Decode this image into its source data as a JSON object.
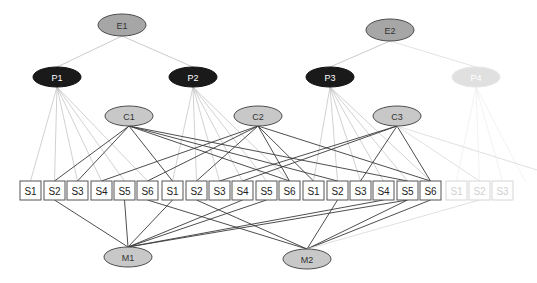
{
  "colors": {
    "e_fill": "#a6a6a6",
    "p_fill": "#1a1a1a",
    "p_faded_fill": "#e0e0e0",
    "c_fill": "#c8c8c8",
    "m_fill": "#c8c8c8",
    "stroke": "#4d4d4d",
    "light_line": "#bdbdbd",
    "dark_line": "#3a3a3a",
    "faded": "#dcdcdc",
    "box_stroke": "#555555"
  },
  "nodes": {
    "E1": {
      "label": "E1",
      "x": 122,
      "y": 25,
      "rx": 24,
      "ry": 11,
      "type": "e"
    },
    "E2": {
      "label": "E2",
      "x": 390,
      "y": 30,
      "rx": 24,
      "ry": 11,
      "type": "e"
    },
    "P1": {
      "label": "P1",
      "x": 57,
      "y": 77,
      "rx": 24,
      "ry": 10,
      "type": "p"
    },
    "P2": {
      "label": "P2",
      "x": 193,
      "y": 77,
      "rx": 24,
      "ry": 10,
      "type": "p"
    },
    "P3": {
      "label": "P3",
      "x": 330,
      "y": 77,
      "rx": 24,
      "ry": 10,
      "type": "p"
    },
    "P4": {
      "label": "P4",
      "x": 476,
      "y": 77,
      "rx": 24,
      "ry": 10,
      "type": "p_faded"
    },
    "C1": {
      "label": "C1",
      "x": 129,
      "y": 116,
      "rx": 24,
      "ry": 10,
      "type": "c"
    },
    "C2": {
      "label": "C2",
      "x": 258,
      "y": 116,
      "rx": 24,
      "ry": 10,
      "type": "c"
    },
    "C3": {
      "label": "C3",
      "x": 397,
      "y": 116,
      "rx": 24,
      "ry": 10,
      "type": "c"
    },
    "M1": {
      "label": "M1",
      "x": 128,
      "y": 257,
      "rx": 24,
      "ry": 10,
      "type": "m"
    },
    "M2": {
      "label": "M2",
      "x": 307,
      "y": 259,
      "rx": 24,
      "ry": 10,
      "type": "m"
    }
  },
  "boxes": [
    {
      "id": "g1s1",
      "label": "S1",
      "x": 20,
      "faded": false
    },
    {
      "id": "g1s2",
      "label": "S2",
      "x": 44,
      "faded": false
    },
    {
      "id": "g1s3",
      "label": "S3",
      "x": 67,
      "faded": false
    },
    {
      "id": "g1s4",
      "label": "S4",
      "x": 91,
      "faded": false
    },
    {
      "id": "g1s5",
      "label": "S5",
      "x": 114,
      "faded": false
    },
    {
      "id": "g1s6",
      "label": "S6",
      "x": 137,
      "faded": false
    },
    {
      "id": "g2s1",
      "label": "S1",
      "x": 162,
      "faded": false
    },
    {
      "id": "g2s2",
      "label": "S2",
      "x": 186,
      "faded": false
    },
    {
      "id": "g2s3",
      "label": "S3",
      "x": 209,
      "faded": false
    },
    {
      "id": "g2s4",
      "label": "S4",
      "x": 232,
      "faded": false
    },
    {
      "id": "g2s5",
      "label": "S5",
      "x": 256,
      "faded": false
    },
    {
      "id": "g2s6",
      "label": "S6",
      "x": 279,
      "faded": false
    },
    {
      "id": "g3s1",
      "label": "S1",
      "x": 303,
      "faded": false
    },
    {
      "id": "g3s2",
      "label": "S2",
      "x": 327,
      "faded": false
    },
    {
      "id": "g3s3",
      "label": "S3",
      "x": 350,
      "faded": false
    },
    {
      "id": "g3s4",
      "label": "S4",
      "x": 373,
      "faded": false
    },
    {
      "id": "g3s5",
      "label": "S5",
      "x": 397,
      "faded": false
    },
    {
      "id": "g3s6",
      "label": "S6",
      "x": 420,
      "faded": false
    },
    {
      "id": "g4s1",
      "label": "S1",
      "x": 446,
      "faded": true
    },
    {
      "id": "g4s2",
      "label": "S2",
      "x": 469,
      "faded": true
    },
    {
      "id": "g4s3",
      "label": "S3",
      "x": 492,
      "faded": true
    }
  ],
  "box_geometry": {
    "top": 181,
    "width": 21,
    "height": 19
  },
  "edges": {
    "e_to_p": [
      [
        "E1",
        "P1"
      ],
      [
        "E1",
        "P2"
      ],
      [
        "E2",
        "P3"
      ],
      [
        "E2",
        "P4"
      ]
    ],
    "p_to_s": [
      [
        "P1",
        "g1s1"
      ],
      [
        "P1",
        "g1s2"
      ],
      [
        "P1",
        "g1s3"
      ],
      [
        "P1",
        "g1s4"
      ],
      [
        "P1",
        "g1s5"
      ],
      [
        "P1",
        "g1s6"
      ],
      [
        "P2",
        "g2s1"
      ],
      [
        "P2",
        "g2s2"
      ],
      [
        "P2",
        "g2s3"
      ],
      [
        "P2",
        "g2s4"
      ],
      [
        "P2",
        "g2s5"
      ],
      [
        "P2",
        "g2s6"
      ],
      [
        "P3",
        "g3s1"
      ],
      [
        "P3",
        "g3s2"
      ],
      [
        "P3",
        "g3s3"
      ],
      [
        "P3",
        "g3s4"
      ],
      [
        "P3",
        "g3s5"
      ],
      [
        "P3",
        "g3s6"
      ],
      [
        "P4",
        "g4s1"
      ],
      [
        "P4",
        "g4s2"
      ],
      [
        "P4",
        "g4s3"
      ],
      [
        "P4",
        "g4s3x"
      ]
    ],
    "c_to_s": [
      [
        "C1",
        "g1s2"
      ],
      [
        "C1",
        "g1s3"
      ],
      [
        "C1",
        "g2s1"
      ],
      [
        "C1",
        "g2s6"
      ],
      [
        "C1",
        "g3s2"
      ],
      [
        "C1",
        "g3s5"
      ],
      [
        "C2",
        "g1s4"
      ],
      [
        "C2",
        "g2s2"
      ],
      [
        "C2",
        "g2s6"
      ],
      [
        "C2",
        "g3s1"
      ],
      [
        "C2",
        "g3s6"
      ],
      [
        "C2",
        "g1s6"
      ],
      [
        "C3",
        "g1s1x"
      ],
      [
        "C3",
        "g2s3"
      ],
      [
        "C3",
        "g3s3"
      ],
      [
        "C3",
        "g3s6"
      ],
      [
        "C3",
        "g4s2"
      ],
      [
        "C3",
        "g2s4"
      ]
    ],
    "s_to_m": [
      [
        "g1s2",
        "M1"
      ],
      [
        "g1s5",
        "M1"
      ],
      [
        "g2s1",
        "M1"
      ],
      [
        "g2s4",
        "M1"
      ],
      [
        "g2s5",
        "M1"
      ],
      [
        "g3s4",
        "M1"
      ],
      [
        "g3s5",
        "M1"
      ],
      [
        "g1s6",
        "M2"
      ],
      [
        "g2s2",
        "M2"
      ],
      [
        "g3s2",
        "M2"
      ],
      [
        "g3s5",
        "M2"
      ],
      [
        "g3s6",
        "M2"
      ],
      [
        "g4s2",
        "M2"
      ]
    ]
  }
}
